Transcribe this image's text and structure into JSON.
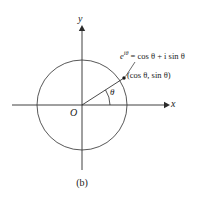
{
  "figure": {
    "caption": "(b)",
    "axes": {
      "x_label": "x",
      "y_label": "y",
      "origin_label": "O"
    },
    "angle_label": "θ",
    "annotations": {
      "euler_formula": "e^{iθ} = cos θ + i sin θ",
      "euler_base": "e",
      "euler_exponent": "iθ",
      "euler_equals": "= cos θ + i sin θ",
      "point_coordinates": "(cos θ, sin θ)"
    },
    "colors": {
      "line": "#2b2b2b",
      "circle": "#3a3a3a",
      "text": "#1a1a1a",
      "background": "#ffffff"
    },
    "geometry": {
      "center_x": 82,
      "center_y": 105,
      "radius": 45,
      "point_x": 124,
      "point_y": 78,
      "angle_degrees": 33
    }
  }
}
